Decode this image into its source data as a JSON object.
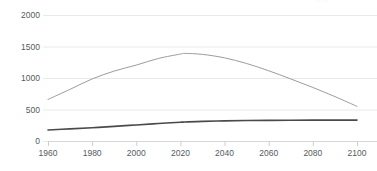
{
  "chart_data": {
    "type": "line",
    "title": "",
    "subtitle": "",
    "xlabel": "",
    "ylabel": "",
    "xlim": [
      1960,
      2100
    ],
    "ylim": [
      0,
      2000
    ],
    "grid": true,
    "grid_axis": "y",
    "legend_position": "top-right-clipped",
    "x_ticks": [
      1960,
      1980,
      2000,
      2020,
      2040,
      2060,
      2080,
      2100
    ],
    "x_tick_labels": [
      "1960",
      "1980",
      "2000",
      "2020",
      "2040",
      "2060",
      "2080",
      "2100"
    ],
    "y_ticks": [
      0,
      500,
      1000,
      1500,
      2000
    ],
    "y_tick_labels": [
      "0",
      "500",
      "1000",
      "1500",
      "2000"
    ],
    "x": [
      1960,
      1970,
      1980,
      1990,
      2000,
      2010,
      2020,
      2022,
      2030,
      2040,
      2050,
      2060,
      2070,
      2080,
      2090,
      2100
    ],
    "series": [
      {
        "name": "series-light",
        "color": "#9c9c9c",
        "width": 1.0,
        "values": [
          660,
          820,
          985,
          1110,
          1205,
          1310,
          1380,
          1390,
          1375,
          1320,
          1230,
          1115,
          985,
          850,
          705,
          550
        ]
      },
      {
        "name": "series-dark",
        "color": "#4a4a4a",
        "width": 1.6,
        "values": [
          175,
          192,
          210,
          232,
          255,
          278,
          298,
          301,
          312,
          320,
          325,
          328,
          330,
          331,
          332,
          332
        ]
      }
    ]
  },
  "axes": {
    "gridline_color": "#e9e9e9",
    "axis_line_color": "#d8d8d8",
    "tick_color": "#cfcfcf",
    "tick_text_color": "#555a5e"
  },
  "legend": {
    "clipped_text": "••  ••"
  },
  "background": {
    "color": "#ffffff"
  }
}
